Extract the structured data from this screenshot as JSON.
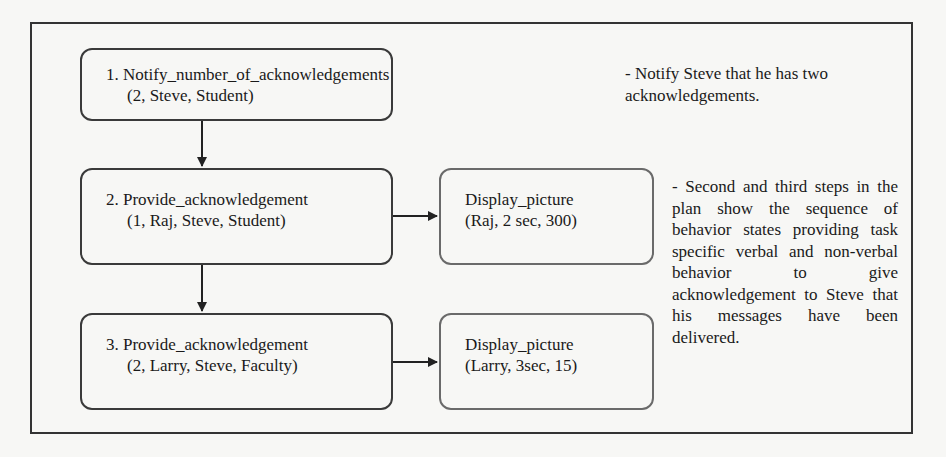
{
  "diagram": {
    "steps": [
      {
        "line1": "1. Notify_number_of_acknowledgements",
        "line2": "(2, Steve, Student)"
      },
      {
        "line1": "2. Provide_acknowledgement",
        "line2": "(1, Raj, Steve, Student)"
      },
      {
        "line1": "3. Provide_acknowledgement",
        "line2": "(2, Larry, Steve, Faculty)"
      }
    ],
    "actions": [
      {
        "line1": "Display_picture",
        "line2": "(Raj, 2 sec, 300)"
      },
      {
        "line1": "Display_picture",
        "line2": "(Larry, 3sec, 15)"
      }
    ],
    "notes": [
      "- Notify Steve that he has two acknowledgements.",
      "- Second and third steps in the plan show the sequence of behavior states providing task specific verbal and non-verbal behavior to give acknowledgement to Steve that his messages have been delivered."
    ]
  }
}
